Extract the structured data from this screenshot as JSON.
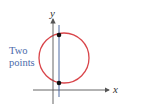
{
  "diagram": {
    "annotation": [
      "Two",
      "points"
    ],
    "x_axis_label": "x",
    "y_axis_label": "y",
    "colors": {
      "circle": "#d9454a",
      "axes": "#555555",
      "vertical_line": "#3a5a99",
      "annotation": "#4a6aaa",
      "points": "#111111"
    }
  }
}
